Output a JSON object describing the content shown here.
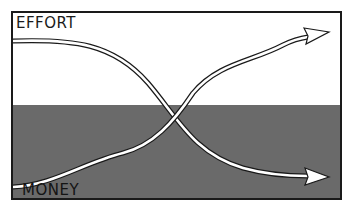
{
  "diagram": {
    "top_label": "EFFORT",
    "bottom_label": "MONEY",
    "colors": {
      "upper_region": "#ffffff",
      "lower_region": "#6a6a6a",
      "border": "#1a1a1a",
      "arrow_fill": "#ffffff",
      "arrow_outline": "#1a1a1a"
    },
    "arrows": [
      {
        "name": "effort-curve",
        "from": "top-left",
        "to": "bottom-right",
        "direction": "decreasing"
      },
      {
        "name": "money-curve",
        "from": "bottom-left",
        "to": "top-right",
        "direction": "increasing"
      }
    ]
  }
}
